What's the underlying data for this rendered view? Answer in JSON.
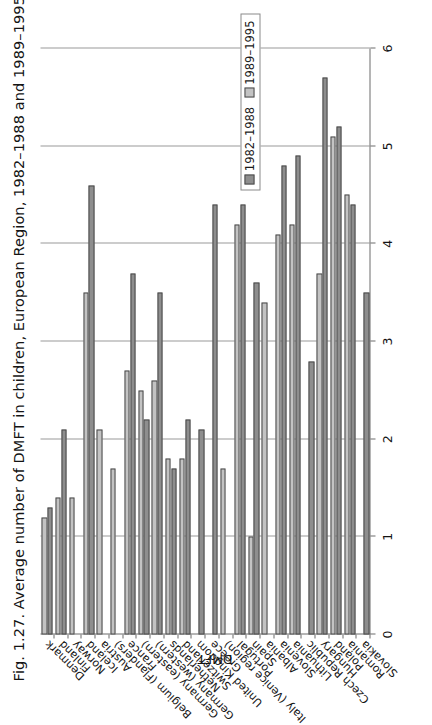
{
  "figure": {
    "title": "Fig. 1.27. Average number of DMFT in children, European Region, 1982–1988 and 1989–1995",
    "background": "#ffffff"
  },
  "legend": {
    "position": "inside-plot-left",
    "entries": [
      {
        "label": "1982–1988",
        "color": "#8e8e8e"
      },
      {
        "label": "1989–1995",
        "color": "#c3c3c3"
      }
    ]
  },
  "axis": {
    "value_axis_title": "DMFT",
    "tick_labels": [
      "0",
      "1",
      "2",
      "3",
      "4",
      "5",
      "6"
    ]
  },
  "chart_data": {
    "type": "bar",
    "title": "Fig. 1.27. Average number of DMFT in children, European Region, 1982–1988 and 1989–1995",
    "orientation": "horizontal",
    "xlabel": "",
    "ylabel": "DMFT",
    "ylim": [
      0,
      6
    ],
    "yticks": [
      0,
      1,
      2,
      3,
      4,
      5,
      6
    ],
    "grid": true,
    "legend": "inside-plot",
    "categories": [
      "Denmark",
      "Finland",
      "Norway",
      "Iceland",
      "Austria",
      "Belgium (Flanders)",
      "France",
      "Germany (eastern)",
      "Germany (western)",
      "Netherlands",
      "Switzerland",
      "United Kingdom",
      "Greece",
      "Italy (Venice region)",
      "Portugal",
      "Spain",
      "Albania",
      "Slovenia",
      "Lithuania",
      "Czech Republic",
      "Hungary",
      "Poland",
      "Romania",
      "Slovakia"
    ],
    "series": [
      {
        "name": "1982–1988",
        "color": "#8e8e8e",
        "values": [
          1.3,
          2.1,
          null,
          4.6,
          null,
          null,
          3.7,
          2.2,
          3.5,
          1.7,
          2.2,
          2.1,
          4.4,
          null,
          4.4,
          3.6,
          null,
          4.8,
          4.9,
          2.8,
          5.7,
          5.2,
          4.4,
          3.5
        ]
      },
      {
        "name": "1989–1995",
        "color": "#c3c3c3",
        "values": [
          1.2,
          1.4,
          1.4,
          3.5,
          2.1,
          1.7,
          2.7,
          2.5,
          2.6,
          1.8,
          1.8,
          null,
          null,
          1.7,
          4.2,
          1.0,
          3.4,
          4.1,
          4.2,
          null,
          3.7,
          5.1,
          4.5,
          null
        ]
      }
    ]
  }
}
